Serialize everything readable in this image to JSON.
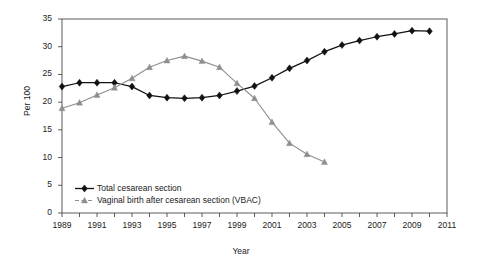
{
  "chart_data": {
    "type": "line",
    "title": "",
    "xlabel": "Year",
    "ylabel": "Per 100",
    "xlim": [
      1989,
      2011
    ],
    "ylim": [
      0,
      35
    ],
    "yticks": [
      0,
      5,
      10,
      15,
      20,
      25,
      30,
      35
    ],
    "xticks_major": [
      1989,
      1991,
      1993,
      1995,
      1997,
      1999,
      2001,
      2003,
      2005,
      2007,
      2009,
      2011
    ],
    "xticks_minor": [
      1990,
      1992,
      1994,
      1996,
      1998,
      2000,
      2002,
      2004,
      2006,
      2008,
      2010
    ],
    "grid": false,
    "legend_position": "inside-bottom-left",
    "x": [
      1989,
      1990,
      1991,
      1992,
      1993,
      1994,
      1995,
      1996,
      1997,
      1998,
      1999,
      2000,
      2001,
      2002,
      2003,
      2004,
      2005,
      2006,
      2007,
      2008,
      2009,
      2010
    ],
    "series": [
      {
        "name": "Total cesarean section",
        "color": "#111111",
        "marker": "diamond",
        "x": [
          1989,
          1990,
          1991,
          1992,
          1993,
          1994,
          1995,
          1996,
          1997,
          1998,
          1999,
          2000,
          2001,
          2002,
          2003,
          2004,
          2005,
          2006,
          2007,
          2008,
          2009,
          2010
        ],
        "values": [
          22.8,
          23.5,
          23.5,
          23.5,
          22.8,
          21.2,
          20.8,
          20.7,
          20.8,
          21.2,
          22.0,
          22.9,
          24.4,
          26.1,
          27.5,
          29.1,
          30.3,
          31.1,
          31.8,
          32.3,
          32.9,
          32.8
        ]
      },
      {
        "name": "Vaginal birth after cesarean section (VBAC)",
        "color": "#8e8e8e",
        "marker": "triangle",
        "x": [
          1989,
          1990,
          1991,
          1992,
          1993,
          1994,
          1995,
          1996,
          1997,
          1998,
          1999,
          2000,
          2001,
          2002,
          2003,
          2004
        ],
        "values": [
          18.9,
          19.9,
          21.3,
          22.6,
          24.3,
          26.3,
          27.5,
          28.3,
          27.4,
          26.3,
          23.4,
          20.7,
          16.4,
          12.6,
          10.6,
          9.2
        ]
      }
    ]
  },
  "legend": {
    "entries": [
      {
        "label": "Total cesarean section"
      },
      {
        "label": "Vaginal birth after cesarean section (VBAC)"
      }
    ]
  }
}
